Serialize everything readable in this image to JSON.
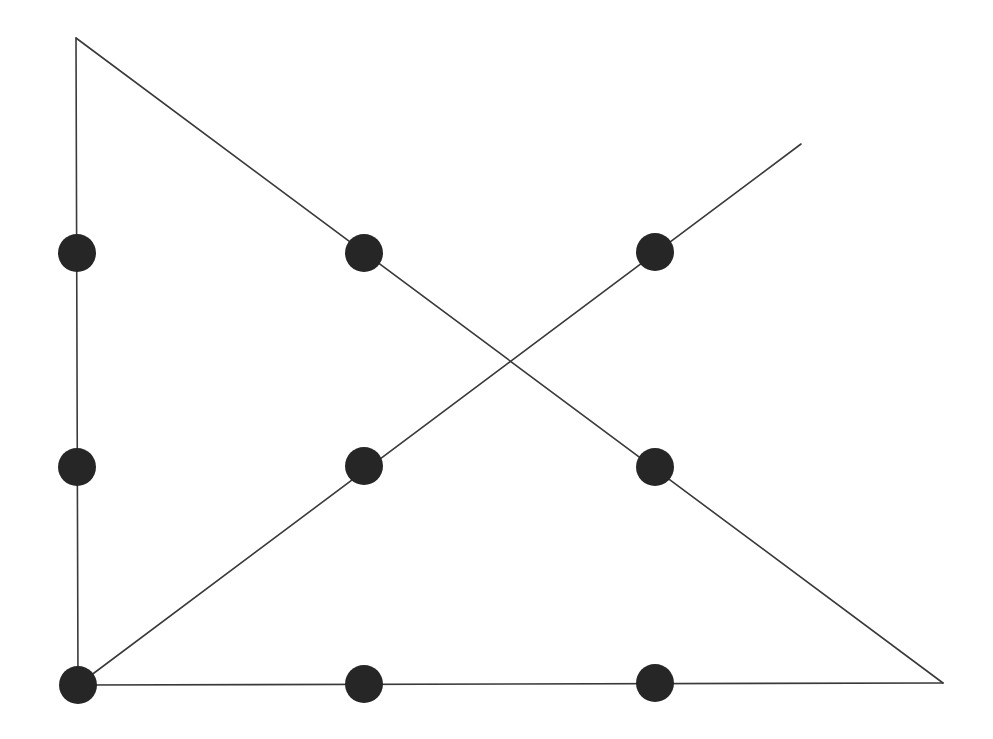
{
  "diagram": {
    "canvas": {
      "width": 993,
      "height": 739,
      "background": "#ffffff"
    },
    "colors": {
      "line": "#3a3a3a",
      "dot": "#262626"
    },
    "dot_radius": 19,
    "dots": [
      {
        "row": 1,
        "col": 1,
        "x": 77,
        "y": 253
      },
      {
        "row": 1,
        "col": 2,
        "x": 364,
        "y": 253
      },
      {
        "row": 1,
        "col": 3,
        "x": 655,
        "y": 252
      },
      {
        "row": 2,
        "col": 1,
        "x": 77,
        "y": 467
      },
      {
        "row": 2,
        "col": 2,
        "x": 364,
        "y": 466
      },
      {
        "row": 2,
        "col": 3,
        "x": 655,
        "y": 467
      },
      {
        "row": 3,
        "col": 1,
        "x": 78,
        "y": 685
      },
      {
        "row": 3,
        "col": 2,
        "x": 364,
        "y": 684
      },
      {
        "row": 3,
        "col": 3,
        "x": 655,
        "y": 683
      }
    ],
    "path": [
      {
        "from": [
          801,
          144
        ],
        "to": [
          78,
          685
        ],
        "label": "diagonal up-right to bottom-left"
      },
      {
        "from": [
          78,
          685
        ],
        "to": [
          943,
          683
        ],
        "label": "bottom horizontal"
      },
      {
        "from": [
          943,
          683
        ],
        "to": [
          76,
          38
        ],
        "label": "long diagonal to top-left apex"
      },
      {
        "from": [
          76,
          38
        ],
        "to": [
          78,
          685
        ],
        "label": "left vertical"
      }
    ]
  }
}
